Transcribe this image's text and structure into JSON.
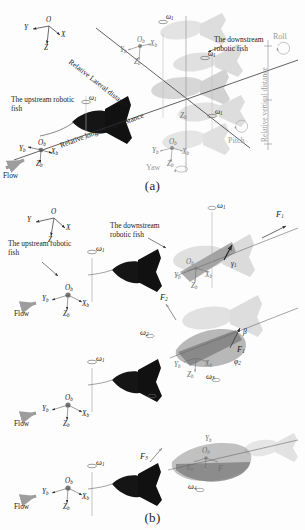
{
  "figure": {
    "domain": "scientific-diagram",
    "colors": {
      "ink": "#1a1a1a",
      "fish_dark": "#141414",
      "fish_light_gray": "#c9c9c9",
      "fish_mid_gray": "#a8a8a8",
      "faint_gray": "#b4b4b4",
      "axis_gray": "#8d8d8d",
      "background": "#fdfdfd"
    },
    "panels": [
      {
        "id": "a",
        "caption": "(a)"
      },
      {
        "id": "b",
        "caption": "(b)"
      }
    ]
  },
  "panel_a": {
    "caption": "(a)",
    "global_frame": {
      "origin": "O",
      "x": "X",
      "y": "Y",
      "z": "Z"
    },
    "body_frame": {
      "origin": "O",
      "origin_sub": "b",
      "x": "X",
      "x_sub": "b",
      "y": "Y",
      "y_sub": "b",
      "z": "Z",
      "z_sub": "b"
    },
    "labels": {
      "upstream_fish": "The upstream robotic fish",
      "downstream_fish": "The downstream robotic fish",
      "flow": "Flow",
      "relative_lateral": "Relative Lateral distance",
      "relative_longitudinal": "Relative longitudinal distance",
      "relative_vertical": "Relative vertical distance",
      "roll": "Roll",
      "pitch": "Pitch",
      "yaw": "Yaw"
    },
    "omega": {
      "symbol": "ω",
      "sub": "1"
    },
    "omega_instances": 4
  },
  "panel_b": {
    "caption": "(b)",
    "global_frame": {
      "origin": "O",
      "x": "X",
      "y": "Y",
      "z": "Z"
    },
    "body_frame": {
      "origin": "O",
      "origin_sub": "b",
      "x": "X",
      "x_sub": "b",
      "y": "Y",
      "y_sub": "b",
      "z": "Z",
      "z_sub": "b"
    },
    "labels": {
      "upstream_fish": "The upstream robotic fish",
      "downstream_fish": "The downstream robotic fish",
      "flow": "Flow"
    },
    "rows": [
      {
        "index": 1,
        "upstream_omega": {
          "symbol": "ω",
          "sub": "1"
        },
        "forces": [
          {
            "symbol": "F",
            "sub": "1"
          }
        ],
        "angles": [
          {
            "symbol": "γ",
            "sub": "1"
          }
        ],
        "downstream_omega": {
          "symbol": "ω",
          "sub": "1"
        }
      },
      {
        "index": 2,
        "upstream_omega": {
          "symbol": "ω",
          "sub": "1"
        },
        "forces": [
          {
            "symbol": "F",
            "sub": "2"
          },
          {
            "symbol": "F",
            "sub": "1"
          }
        ],
        "angles": [
          {
            "symbol": "β",
            "sub": ""
          },
          {
            "symbol": "φ",
            "sub": "2"
          }
        ],
        "downstream_omega": {
          "symbol": "ω",
          "sub": "2"
        },
        "extra_omega": {
          "symbol": "ω",
          "sub": "3"
        }
      },
      {
        "index": 3,
        "upstream_omega": {
          "symbol": "ω",
          "sub": "1"
        },
        "forces": [
          {
            "symbol": "F",
            "sub": "3"
          },
          {
            "symbol": "F",
            "sub": ""
          }
        ],
        "angles": [],
        "downstream_omega": {
          "symbol": "ω",
          "sub": "4"
        }
      }
    ]
  }
}
